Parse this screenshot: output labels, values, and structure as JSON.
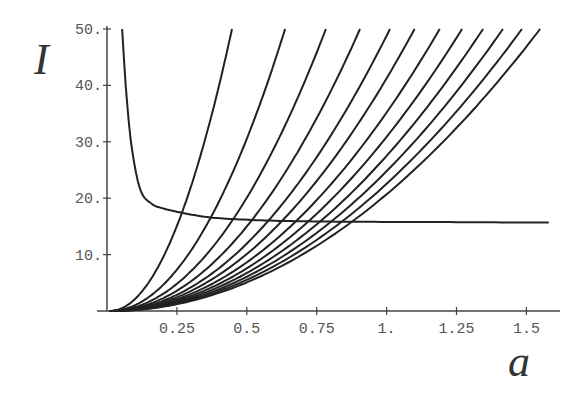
{
  "chart_data": {
    "type": "line",
    "title": "",
    "xlabel": "a",
    "ylabel": "I",
    "xlim": [
      0,
      1.6
    ],
    "ylim": [
      0,
      50
    ],
    "grid": false,
    "legend": null,
    "x_ticks": [
      0.25,
      0.5,
      0.75,
      1.0,
      1.25,
      1.5
    ],
    "x_tick_labels": [
      "0.25",
      "0.5",
      "0.75",
      "1.",
      "1.25",
      "1.5"
    ],
    "y_ticks": [
      10,
      20,
      30,
      40,
      50
    ],
    "y_tick_labels": [
      "10.",
      "20.",
      "30.",
      "40.",
      "50."
    ],
    "series": [
      {
        "name": "increasing-1",
        "model": "I = 50*(a/0.447)^2",
        "a_at_I50": 0.447
      },
      {
        "name": "increasing-2",
        "model": "I = 50*(a/0.637)^2",
        "a_at_I50": 0.637
      },
      {
        "name": "increasing-3",
        "model": "I = 50*(a/0.783)^2",
        "a_at_I50": 0.783
      },
      {
        "name": "increasing-4",
        "model": "I = 50*(a/0.905)^2",
        "a_at_I50": 0.905
      },
      {
        "name": "increasing-5",
        "model": "I = 50*(a/1.012)^2",
        "a_at_I50": 1.012
      },
      {
        "name": "increasing-6",
        "model": "I = 50*(a/1.100)^2",
        "a_at_I50": 1.1
      },
      {
        "name": "increasing-7",
        "model": "I = 50*(a/1.190)^2",
        "a_at_I50": 1.19
      },
      {
        "name": "increasing-8",
        "model": "I = 50*(a/1.270)^2",
        "a_at_I50": 1.27
      },
      {
        "name": "increasing-9",
        "model": "I = 50*(a/1.345)^2",
        "a_at_I50": 1.345
      },
      {
        "name": "increasing-10",
        "model": "I = 50*(a/1.416)^2",
        "a_at_I50": 1.416
      },
      {
        "name": "increasing-11",
        "model": "I = 50*(a/1.484)^2",
        "a_at_I50": 1.484
      },
      {
        "name": "increasing-12",
        "model": "I = 50*(a/1.549)^2",
        "a_at_I50": 1.549
      },
      {
        "name": "decreasing",
        "x": [
          0.054,
          0.07,
          0.09,
          0.12,
          0.16,
          0.2,
          0.26,
          0.35,
          0.45,
          0.6,
          0.8,
          1.0,
          1.25,
          1.5,
          1.58
        ],
        "y": [
          50,
          38,
          28.5,
          21.4,
          19.0,
          18.2,
          17.5,
          16.7,
          16.3,
          16.0,
          15.85,
          15.8,
          15.75,
          15.7,
          15.7
        ]
      }
    ]
  }
}
